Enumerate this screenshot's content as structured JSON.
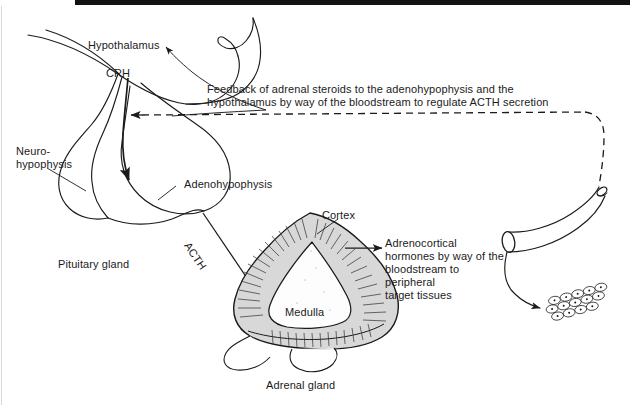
{
  "figure": {
    "caption": "Adrenal gland",
    "ink_color": "#1b1b1b",
    "cortex_fill": "#d8d8d8",
    "medulla_fill": "#fdfdfd",
    "background": "#ffffff",
    "artifact_bar_color": "#121212"
  },
  "labels": {
    "hypothalamus": "Hypothalamus",
    "crh": "CRH",
    "neurohypophysis_line1": "Neuro-",
    "neurohypophysis_line2": "hypophysis",
    "adenohypophysis": "Adenohypophysis",
    "pituitary_gland": "Pituitary gland",
    "acth": "ACTH",
    "cortex": "Cortex",
    "medulla": "Medulla",
    "adrenal_gland": "Adrenal gland"
  },
  "annotations": {
    "feedback_line1": "Feedback of adrenal steroids to the adenohypophysis and the",
    "feedback_line2": "hypothalamus by way of the bloodstream to regulate ACTH secretion",
    "hormones_line1": "Adrenocortical",
    "hormones_line2": "hormones by way of the",
    "hormones_line3": "bloodstream to",
    "hormones_line4": "peripheral",
    "hormones_line5": "target tissues"
  },
  "structures": {
    "hypothalamus_shape": "brain-stem-hook",
    "pituitary_shape": "two-lobed-gland",
    "adrenal_shape": "triangular-cross-section",
    "vessel_shape": "curved-cylinder-blood-vessel",
    "target_tissue_shape": "epithelial-cell-cluster"
  }
}
